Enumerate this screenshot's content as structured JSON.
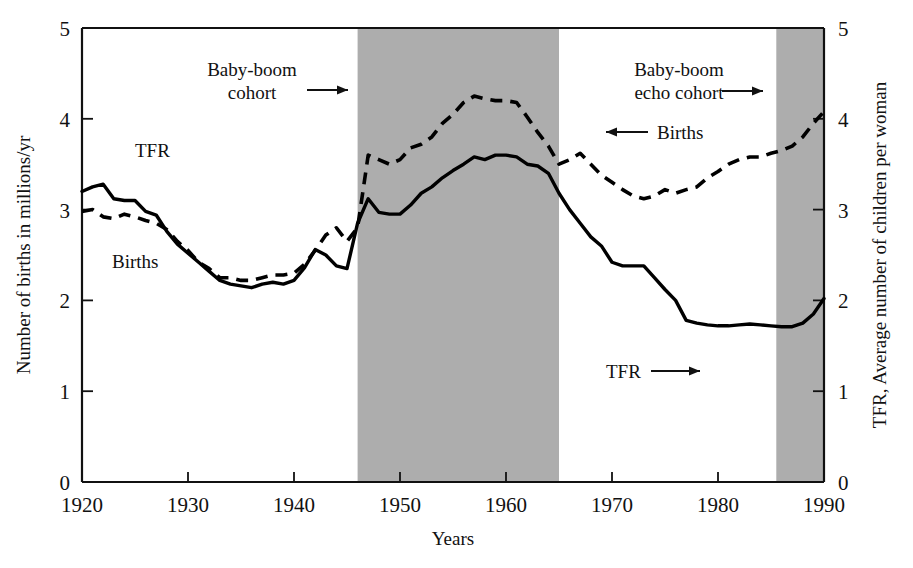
{
  "chart_data": {
    "type": "line",
    "title": "",
    "xlabel": "Years",
    "ylabel": "Number of births in millions/yr",
    "ylabel_right": "TFR, Average number of children per woman",
    "xlim": [
      1920,
      1990
    ],
    "ylim": [
      0,
      5
    ],
    "ylim_right": [
      0,
      5
    ],
    "grid": false,
    "legend_position": "inline-annotations",
    "x_ticks": [
      "1920",
      "1930",
      "1940",
      "1950",
      "1960",
      "1970",
      "1980",
      "1990"
    ],
    "x_tick_values": [
      1920,
      1930,
      1940,
      1950,
      1960,
      1970,
      1980,
      1990
    ],
    "y_ticks": [
      "0",
      "1",
      "2",
      "3",
      "4",
      "5"
    ],
    "y_tick_values": [
      0,
      1,
      2,
      3,
      4,
      5
    ],
    "y_ticks_right": [
      "0",
      "1",
      "2",
      "3",
      "4",
      "5"
    ],
    "y_tick_values_right": [
      0,
      1,
      2,
      3,
      4,
      5
    ],
    "series": [
      {
        "name": "Births",
        "style": "solid",
        "color": "#000000",
        "axis": "left",
        "units": "millions per year",
        "x": [
          1920,
          1921,
          1922,
          1923,
          1924,
          1925,
          1926,
          1927,
          1928,
          1929,
          1930,
          1931,
          1932,
          1933,
          1934,
          1935,
          1936,
          1937,
          1938,
          1939,
          1940,
          1941,
          1942,
          1943,
          1944,
          1945,
          1946,
          1947,
          1948,
          1949,
          1950,
          1951,
          1952,
          1953,
          1954,
          1955,
          1956,
          1957,
          1958,
          1959,
          1960,
          1961,
          1962,
          1963,
          1964,
          1965,
          1966,
          1967,
          1968,
          1969,
          1970,
          1971,
          1972,
          1973,
          1974,
          1975,
          1976,
          1977,
          1978,
          1979,
          1980,
          1981,
          1982,
          1983,
          1984,
          1985,
          1986,
          1987,
          1988,
          1989,
          1990
        ],
        "values": [
          3.2,
          3.25,
          3.28,
          3.12,
          3.1,
          3.1,
          2.98,
          2.94,
          2.76,
          2.62,
          2.52,
          2.42,
          2.32,
          2.22,
          2.18,
          2.16,
          2.14,
          2.18,
          2.2,
          2.18,
          2.22,
          2.36,
          2.56,
          2.5,
          2.38,
          2.35,
          2.85,
          3.12,
          2.97,
          2.95,
          2.95,
          3.05,
          3.18,
          3.25,
          3.35,
          3.43,
          3.5,
          3.58,
          3.55,
          3.6,
          3.6,
          3.58,
          3.5,
          3.48,
          3.4,
          3.18,
          3.0,
          2.85,
          2.7,
          2.6,
          2.42,
          2.38,
          2.38,
          2.38,
          2.25,
          2.12,
          2.0,
          1.78,
          1.75,
          1.73,
          1.72,
          1.72,
          1.73,
          1.74,
          1.73,
          1.72,
          1.71,
          1.71,
          1.75,
          1.85,
          2.02
        ]
      },
      {
        "name": "TFR",
        "style": "dashed",
        "color": "#000000",
        "axis": "right",
        "units": "average children per woman",
        "x": [
          1920,
          1921,
          1922,
          1923,
          1924,
          1925,
          1926,
          1927,
          1928,
          1929,
          1930,
          1931,
          1932,
          1933,
          1934,
          1935,
          1936,
          1937,
          1938,
          1939,
          1940,
          1941,
          1942,
          1943,
          1944,
          1945,
          1946,
          1947,
          1948,
          1949,
          1950,
          1951,
          1952,
          1953,
          1954,
          1955,
          1956,
          1957,
          1958,
          1959,
          1960,
          1961,
          1962,
          1963,
          1964,
          1965,
          1966,
          1967,
          1968,
          1969,
          1970,
          1971,
          1972,
          1973,
          1974,
          1975,
          1976,
          1977,
          1978,
          1979,
          1980,
          1981,
          1982,
          1983,
          1984,
          1985,
          1986,
          1987,
          1988,
          1989,
          1990
        ],
        "values": [
          2.98,
          3.0,
          2.92,
          2.9,
          2.95,
          2.92,
          2.88,
          2.85,
          2.78,
          2.65,
          2.55,
          2.42,
          2.35,
          2.25,
          2.25,
          2.22,
          2.22,
          2.25,
          2.28,
          2.28,
          2.3,
          2.4,
          2.55,
          2.72,
          2.8,
          2.65,
          2.8,
          3.6,
          3.55,
          3.5,
          3.55,
          3.68,
          3.72,
          3.8,
          3.95,
          4.05,
          4.18,
          4.25,
          4.22,
          4.2,
          4.2,
          4.18,
          4.02,
          3.85,
          3.7,
          3.5,
          3.55,
          3.62,
          3.5,
          3.38,
          3.3,
          3.22,
          3.15,
          3.12,
          3.15,
          3.22,
          3.18,
          3.22,
          3.25,
          3.35,
          3.42,
          3.5,
          3.55,
          3.58,
          3.58,
          3.62,
          3.65,
          3.7,
          3.8,
          3.95,
          4.08
        ]
      }
    ],
    "shaded_bands": [
      {
        "label": "Baby-boom cohort",
        "start": 1946,
        "end": 1965,
        "color": "#adadad"
      },
      {
        "label": "Baby-boom echo cohort",
        "start": 1985.5,
        "end": 1990,
        "color": "#adadad"
      }
    ],
    "annotations": [
      {
        "name": "baby-boom-cohort-annotation",
        "text_line1": "Baby-boom",
        "text_line2": "cohort",
        "arrow": "right"
      },
      {
        "name": "baby-boom-echo-cohort-annotation",
        "text_line1": "Baby-boom",
        "text_line2": "echo cohort",
        "arrow": "right"
      },
      {
        "name": "births-pointer-annotation",
        "text": "Births",
        "arrow": "left"
      },
      {
        "name": "tfr-pointer-annotation",
        "text": "TFR",
        "arrow": "right"
      },
      {
        "name": "tfr-inline-label",
        "text": "TFR",
        "arrow": "none"
      },
      {
        "name": "births-inline-label",
        "text": "Births",
        "arrow": "none"
      }
    ]
  },
  "labels": {
    "y_axis_left": "Number of births in millions/yr",
    "y_axis_right": "TFR, Average number of children per woman",
    "x_axis": "Years",
    "tfr_inline": "TFR",
    "births_inline": "Births",
    "baby_boom_l1": "Baby-boom",
    "baby_boom_l2": "cohort",
    "echo_l1": "Baby-boom",
    "echo_l2": "echo cohort",
    "births_arrow_label": "Births",
    "tfr_arrow_label": "TFR"
  },
  "ticks": {
    "x": [
      "1920",
      "1930",
      "1940",
      "1950",
      "1960",
      "1970",
      "1980",
      "1990"
    ],
    "y_left": [
      "5",
      "4",
      "3",
      "2",
      "1",
      "0"
    ],
    "y_right": [
      "5",
      "4",
      "3",
      "2",
      "1",
      "0"
    ]
  },
  "colors": {
    "band": "#adadad",
    "line": "#000000",
    "background": "#ffffff",
    "text": "#111111"
  }
}
